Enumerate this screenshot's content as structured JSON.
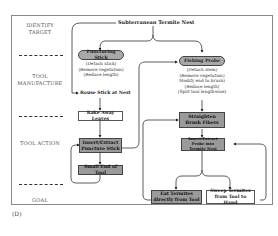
{
  "panel_label": "(D)",
  "stages": [
    {
      "id": "identify",
      "label": "IDENTIFY\nTARGET"
    },
    {
      "id": "manufacture",
      "label": "TOOL\nMANUFACTURE"
    },
    {
      "id": "action",
      "label": "TOOL ACTION"
    },
    {
      "id": "goal",
      "label": "GOAL"
    }
  ],
  "nodes": {
    "nest": "Subterranean Termite Nest",
    "puncturing_stick": "Puncturing Stick",
    "puncturing_steps": [
      "(Detach stick)",
      "(Remove vegetation)",
      "(Reduce length)"
    ],
    "rouse_stick": "Rouse Stick at Nest",
    "fishing_probe": "Fishing Probe",
    "fishing_steps": [
      "(Detach stem)",
      "(Remove vegetation)",
      "Modify end to brush)",
      "(Reduce length)",
      "(Split tool lengthwise)"
    ],
    "rake_leaves": "Rake Away Leaves",
    "insert_puncture": "Insert/Extract Puncture Stick",
    "small_end": "Small End of Tool",
    "straighten_fibers": "Straighten Brush Fibers",
    "insert_probe": "Insert/Extract Probe into Termite Nest",
    "eat_termites": "Eat Termites directly from Tool",
    "sweep_termites": "Sweep Termites from Tool to Hand"
  },
  "colors": {
    "dark_box": "#9a9a9a",
    "pill": "#a8a8a8",
    "line": "#333333"
  }
}
